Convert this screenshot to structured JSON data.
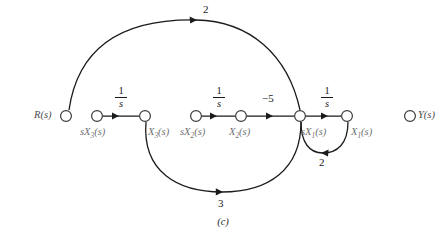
{
  "figure": {
    "caption": "(c)",
    "type": "signal-flow-graph",
    "width": 446,
    "height": 247,
    "background": "#ffffff",
    "edge_color": "#1b1b1b",
    "node_stroke": "#3a3a3c",
    "node_fill": "#ffffff",
    "label_color": "#6f6f72",
    "label_color_dark": "#4a4a4d"
  },
  "nodes": [
    {
      "id": "R",
      "label_main": "R",
      "label_sub": "",
      "label_tail": "(s)",
      "x": 66,
      "y": 116,
      "label_x": 34,
      "label_y": 112,
      "tone": "dark"
    },
    {
      "id": "sX3",
      "label_main": "sX",
      "label_sub": "3",
      "label_tail": "(s)",
      "x": 97,
      "y": 116,
      "label_x": 82,
      "label_y": 127,
      "tone": "light"
    },
    {
      "id": "X3",
      "label_main": "X",
      "label_sub": "3",
      "label_tail": "(s)",
      "x": 145,
      "y": 116,
      "label_x": 148,
      "label_y": 127,
      "tone": "light"
    },
    {
      "id": "sX2",
      "label_main": "sX",
      "label_sub": "2",
      "label_tail": "(s)",
      "x": 196,
      "y": 116,
      "label_x": 182,
      "label_y": 127,
      "tone": "light"
    },
    {
      "id": "X2",
      "label_main": "X",
      "label_sub": "2",
      "label_tail": "(s)",
      "x": 241,
      "y": 116,
      "label_x": 231,
      "label_y": 127,
      "tone": "light"
    },
    {
      "id": "sX1",
      "label_main": "sX",
      "label_sub": "1",
      "label_tail": "(s)",
      "x": 300,
      "y": 116,
      "label_x": 303,
      "label_y": 127,
      "tone": "light"
    },
    {
      "id": "X1",
      "label_main": "X",
      "label_sub": "1",
      "label_tail": "(s)",
      "x": 347,
      "y": 116,
      "label_x": 350,
      "label_y": 127,
      "tone": "light"
    },
    {
      "id": "Y",
      "label_main": "Y",
      "label_sub": "",
      "label_tail": "(s)",
      "x": 410,
      "y": 116,
      "label_x": 418,
      "label_y": 112,
      "tone": "dark"
    }
  ],
  "edges": [
    {
      "id": "e-sX3-X3",
      "from": "sX3",
      "to": "X3",
      "shape": "straight",
      "gain_type": "fraction",
      "gain_num": "1",
      "gain_den": "s",
      "gain_x": 113,
      "gain_y": 87,
      "arrow_x": 124,
      "arrow_y": 116
    },
    {
      "id": "e-sX2-X2",
      "from": "sX2",
      "to": "X2",
      "shape": "straight",
      "gain_type": "fraction",
      "gain_num": "1",
      "gain_den": "s",
      "gain_x": 211,
      "gain_y": 87,
      "arrow_x": 222,
      "arrow_y": 116
    },
    {
      "id": "e-X2-sX1",
      "from": "X2",
      "to": "sX1",
      "shape": "straight",
      "gain_type": "text",
      "gain_text": "−5",
      "gain_x": 262,
      "gain_y": 93,
      "arrow_x": 274,
      "arrow_y": 116
    },
    {
      "id": "e-sX1-X1",
      "from": "sX1",
      "to": "X1",
      "shape": "straight",
      "gain_type": "fraction",
      "gain_num": "1",
      "gain_den": "s",
      "gain_x": 323,
      "gain_y": 87,
      "arrow_x": 330,
      "arrow_y": 116
    },
    {
      "id": "e-R-sX1",
      "from": "R",
      "to": "sX1",
      "shape": "arc-top",
      "gain_type": "text",
      "gain_text": "2",
      "gain_x": 206,
      "gain_y": 5,
      "arrow_x": 192,
      "arrow_y": 22
    },
    {
      "id": "e-X3-sX1",
      "from": "X3",
      "to": "sX1",
      "shape": "arc-bottom",
      "gain_type": "text",
      "gain_text": "3",
      "gain_x": 219,
      "gain_y": 199,
      "arrow_x": 222,
      "arrow_y": 190
    },
    {
      "id": "e-X1-sX1",
      "from": "X1",
      "to": "sX1",
      "shape": "arc-loop",
      "gain_type": "text",
      "gain_text": "2",
      "gain_x": 320,
      "gain_y": 158,
      "arrow_x": 327,
      "arrow_y": 148
    }
  ]
}
